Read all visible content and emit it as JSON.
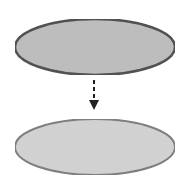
{
  "diagram": {
    "width": 191,
    "height": 188,
    "background": "#ffffff",
    "nodes": [
      {
        "id": "top-ellipse",
        "shape": "ellipse",
        "cx": 95,
        "cy": 47,
        "rx": 80,
        "ry": 28,
        "fill": "#bdbdbd",
        "stroke": "#444444",
        "stroke_width": 2.5
      },
      {
        "id": "bottom-ellipse",
        "shape": "ellipse",
        "cx": 95,
        "cy": 147,
        "rx": 80,
        "ry": 28,
        "fill": "#d3d3d3",
        "stroke": "#7a7a7a",
        "stroke_width": 2
      }
    ],
    "edges": [
      {
        "from": "top-ellipse",
        "to": "bottom-ellipse",
        "style": "dashed",
        "direction": "down",
        "x": 94,
        "y1": 80,
        "y2": 100,
        "arrowhead_tip_y": 110,
        "color": "#222222"
      }
    ]
  }
}
